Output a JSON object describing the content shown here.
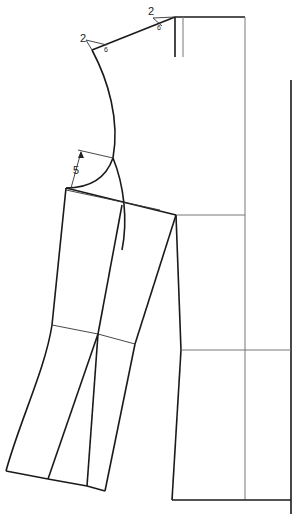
{
  "diagram": {
    "type": "sewing-pattern",
    "annotations": [
      {
        "id": "shoulder-ext-top",
        "value": "2",
        "sub": "6"
      },
      {
        "id": "shoulder-ext-left",
        "value": "2",
        "sub": "6"
      },
      {
        "id": "sleeve-drop",
        "value": "5"
      }
    ],
    "colors": {
      "line": "#1a1a1a",
      "guide": "#777777",
      "background": "#ffffff"
    }
  }
}
